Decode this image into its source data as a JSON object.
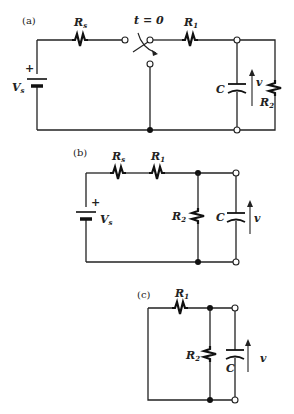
{
  "figure": {
    "panels": [
      {
        "id": "a",
        "tag": "(a)",
        "labels": {
          "source": "V",
          "source_sub": "s",
          "source_polarity": "+",
          "rs": "R",
          "rs_sub": "s",
          "switch_time": "t = 0",
          "r1": "R",
          "r1_sub": "1",
          "cap": "C",
          "voltage": "v",
          "r2": "R",
          "r2_sub": "2"
        }
      },
      {
        "id": "b",
        "tag": "(b)",
        "labels": {
          "source": "V",
          "source_sub": "s",
          "source_polarity": "+",
          "rs": "R",
          "rs_sub": "s",
          "r1": "R",
          "r1_sub": "1",
          "r2": "R",
          "r2_sub": "2",
          "cap": "C",
          "voltage": "v"
        }
      },
      {
        "id": "c",
        "tag": "(c)",
        "labels": {
          "r1": "R",
          "r1_sub": "1",
          "r2": "R",
          "r2_sub": "2",
          "cap": "C",
          "voltage": "v"
        }
      }
    ]
  }
}
